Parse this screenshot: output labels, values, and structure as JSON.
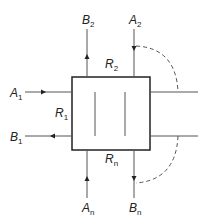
{
  "diagram": {
    "type": "multi-stream block diagram",
    "colors": {
      "line": "#222222",
      "inner_line": "#555555",
      "dashed": "#555555"
    },
    "block": {
      "label_inner": "two internal partitions"
    },
    "labels": {
      "A1": {
        "main": "A",
        "sub": "1"
      },
      "B1": {
        "main": "B",
        "sub": "1"
      },
      "R1": {
        "main": "R",
        "sub": "1"
      },
      "A2": {
        "main": "A",
        "sub": "2"
      },
      "B2": {
        "main": "B",
        "sub": "2"
      },
      "R2": {
        "main": "R",
        "sub": "2"
      },
      "An": {
        "main": "A",
        "sub": "n"
      },
      "Bn": {
        "main": "B",
        "sub": "n"
      },
      "Rn": {
        "main": "R",
        "sub": "n"
      }
    }
  }
}
